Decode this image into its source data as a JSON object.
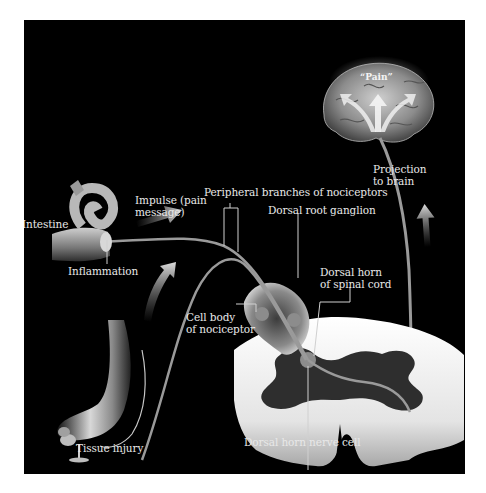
{
  "figure": {
    "background": "#000000",
    "page_background": "#ffffff",
    "label_color": "#e8e8e8",
    "pathway_color": "#9a9a9a"
  },
  "labels": {
    "pain": "“Pain”",
    "projection_line1": "Projection",
    "projection_line2": "to brain",
    "impulse_line1": "Impulse (pain",
    "impulse_line2": "message)",
    "peripheral_branches": "Peripheral branches of nociceptors",
    "intestine": "Intestine",
    "inflammation": "Inflammation",
    "dorsal_root_ganglion": "Dorsal root ganglion",
    "dorsal_horn_line1": "Dorsal horn",
    "dorsal_horn_line2": "of spinal cord",
    "cell_body_line1": "Cell body",
    "cell_body_line2": "of nociceptor",
    "tissue_injury": "Tissue injury",
    "dorsal_horn_nerve_cell": "Dorsal horn nerve cell"
  },
  "structures": [
    "brain",
    "intestine",
    "leg-and-foot",
    "tack",
    "dorsal-root-ganglion",
    "spinal-cord-cross-section"
  ],
  "arrows": [
    "impulse-arrow",
    "leg-upward-arrow",
    "projection-upward-arrow",
    "brain-pain-arrows"
  ]
}
